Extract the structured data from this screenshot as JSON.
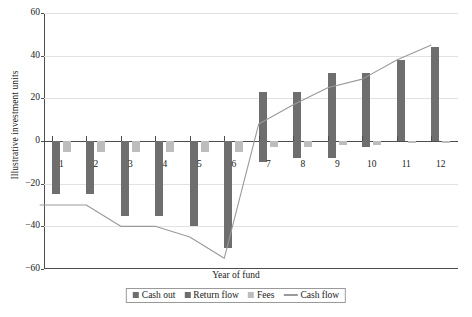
{
  "chart_data": {
    "type": "bar",
    "title": "",
    "xlabel": "Year of fund",
    "ylabel": "Illustrative investment units",
    "categories": [
      "1",
      "2",
      "3",
      "4",
      "5",
      "6",
      "7",
      "8",
      "9",
      "10",
      "11",
      "12"
    ],
    "ylim": [
      -60,
      60
    ],
    "yticks": [
      60,
      40,
      20,
      0,
      -20,
      -40,
      -60
    ],
    "ytick_labels": [
      "60",
      "40",
      "20",
      "0",
      "−20",
      "−40",
      "−60"
    ],
    "grid": true,
    "legend_position": "bottom",
    "series": [
      {
        "name": "Cash out",
        "kind": "bar",
        "color": "#6e6e6e",
        "values": [
          -25,
          -25,
          -35,
          -35,
          -40,
          -50,
          -10,
          -8,
          -8,
          -3,
          0,
          0
        ]
      },
      {
        "name": "Return flow",
        "kind": "bar",
        "color": "#6e6e6e",
        "values": [
          0,
          0,
          0,
          0,
          0,
          0,
          23,
          23,
          32,
          32,
          38,
          44
        ]
      },
      {
        "name": "Fees",
        "kind": "bar",
        "color": "#bdbdbd",
        "values": [
          -5,
          -5,
          -5,
          -5,
          -5,
          -5,
          -3,
          -3,
          -2,
          -2,
          -1,
          -1
        ]
      },
      {
        "name": "Cash flow",
        "kind": "line",
        "color": "#9a9a9a",
        "values": [
          -30,
          -30,
          -40,
          -40,
          -45,
          -55,
          8,
          17,
          25,
          29,
          38,
          45
        ]
      }
    ]
  },
  "legend": {
    "items": [
      {
        "label": "Cash out",
        "marker": "square-dark",
        "color": "#6e6e6e"
      },
      {
        "label": "Return flow",
        "marker": "square-dark",
        "color": "#6e6e6e"
      },
      {
        "label": "Fees",
        "marker": "square-light",
        "color": "#bdbdbd"
      },
      {
        "label": "Cash flow",
        "marker": "line",
        "color": "#9a9a9a"
      }
    ]
  }
}
